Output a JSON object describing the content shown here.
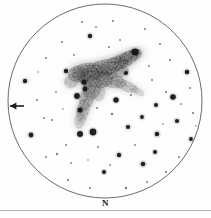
{
  "figure": {
    "kind": "astronomical-eyepiece-sketch",
    "width": 211,
    "height": 218,
    "background_color": "#fefefe",
    "caption": "N",
    "caption_x": 105,
    "caption_y": 198,
    "rule_y": 210,
    "rule_color": "#b4b4b4"
  },
  "field_circle": {
    "label": "eyepiece field of view",
    "cx": 105,
    "cy": 101,
    "r": 97,
    "stroke": "#5a5a5a",
    "stroke_width": 0.9,
    "fill": "none"
  },
  "direction_arrow": {
    "label": "direction marker arrow",
    "points_to": "left",
    "x1": 24,
    "y1": 106,
    "x2": 10,
    "y2": 106,
    "color": "#1c1c1c",
    "stroke_width": 1.6,
    "head_size": 4
  },
  "nebula": {
    "label": "diffuse nebula",
    "color": "#8e8e8e",
    "blobs": [
      {
        "cx": 120,
        "cy": 62,
        "rx": 26,
        "ry": 8,
        "rot": -24,
        "op": 0.42
      },
      {
        "cx": 104,
        "cy": 68,
        "rx": 28,
        "ry": 9,
        "rot": -16,
        "op": 0.46
      },
      {
        "cx": 128,
        "cy": 57,
        "rx": 16,
        "ry": 6,
        "rot": -27,
        "op": 0.5
      },
      {
        "cx": 88,
        "cy": 72,
        "rx": 18,
        "ry": 10,
        "rot": -6,
        "op": 0.45
      },
      {
        "cx": 78,
        "cy": 74,
        "rx": 11,
        "ry": 9,
        "rot": 0,
        "op": 0.38
      },
      {
        "cx": 95,
        "cy": 78,
        "rx": 20,
        "ry": 11,
        "rot": 8,
        "op": 0.4
      },
      {
        "cx": 110,
        "cy": 80,
        "rx": 18,
        "ry": 8,
        "rot": 14,
        "op": 0.34
      },
      {
        "cx": 126,
        "cy": 86,
        "rx": 14,
        "ry": 6,
        "rot": 22,
        "op": 0.26
      },
      {
        "cx": 137,
        "cy": 91,
        "rx": 9,
        "ry": 4,
        "rot": 26,
        "op": 0.2
      },
      {
        "cx": 92,
        "cy": 88,
        "rx": 10,
        "ry": 13,
        "rot": 16,
        "op": 0.36
      },
      {
        "cx": 87,
        "cy": 98,
        "rx": 8,
        "ry": 14,
        "rot": 14,
        "op": 0.34
      },
      {
        "cx": 83,
        "cy": 110,
        "rx": 7,
        "ry": 13,
        "rot": 12,
        "op": 0.3
      },
      {
        "cx": 80,
        "cy": 120,
        "rx": 6,
        "ry": 10,
        "rot": 10,
        "op": 0.24
      },
      {
        "cx": 99,
        "cy": 93,
        "rx": 7,
        "ry": 9,
        "rot": 0,
        "op": 0.22
      },
      {
        "cx": 71,
        "cy": 82,
        "rx": 8,
        "ry": 7,
        "rot": 0,
        "op": 0.28
      },
      {
        "cx": 116,
        "cy": 72,
        "rx": 14,
        "ry": 7,
        "rot": -10,
        "op": 0.3
      }
    ]
  },
  "stars": {
    "label": "plotted field stars",
    "color": "#141414",
    "list": [
      {
        "x": 135,
        "y": 52,
        "r": 3.6
      },
      {
        "x": 93,
        "y": 132,
        "r": 3.4
      },
      {
        "x": 80,
        "y": 134,
        "r": 3.0
      },
      {
        "x": 77,
        "y": 96,
        "r": 2.9
      },
      {
        "x": 84,
        "y": 82,
        "r": 2.6
      },
      {
        "x": 85,
        "y": 89,
        "r": 2.4
      },
      {
        "x": 80,
        "y": 110,
        "r": 2.6
      },
      {
        "x": 173,
        "y": 97,
        "r": 2.8
      },
      {
        "x": 116,
        "y": 100,
        "r": 2.7
      },
      {
        "x": 66,
        "y": 71,
        "r": 2.2
      },
      {
        "x": 25,
        "y": 81,
        "r": 2.2
      },
      {
        "x": 31,
        "y": 135,
        "r": 2.4
      },
      {
        "x": 187,
        "y": 72,
        "r": 2.3
      },
      {
        "x": 126,
        "y": 73,
        "r": 2.1
      },
      {
        "x": 90,
        "y": 36,
        "r": 2.2
      },
      {
        "x": 157,
        "y": 134,
        "r": 2.3
      },
      {
        "x": 143,
        "y": 164,
        "r": 2.3
      },
      {
        "x": 119,
        "y": 155,
        "r": 2.2
      },
      {
        "x": 177,
        "y": 121,
        "r": 2.1
      },
      {
        "x": 156,
        "y": 105,
        "r": 2.0
      },
      {
        "x": 128,
        "y": 127,
        "r": 2.1
      },
      {
        "x": 142,
        "y": 117,
        "r": 1.9
      },
      {
        "x": 104,
        "y": 172,
        "r": 2.0
      },
      {
        "x": 155,
        "y": 152,
        "r": 2.0
      },
      {
        "x": 191,
        "y": 139,
        "r": 1.9
      },
      {
        "x": 112,
        "y": 114,
        "r": 1.2
      },
      {
        "x": 57,
        "y": 154,
        "r": 1.2
      },
      {
        "x": 97,
        "y": 108,
        "r": 1.0
      },
      {
        "x": 46,
        "y": 157,
        "r": 1.0
      },
      {
        "x": 68,
        "y": 180,
        "r": 1.1
      },
      {
        "x": 90,
        "y": 188,
        "r": 1.0
      },
      {
        "x": 126,
        "y": 188,
        "r": 1.2
      },
      {
        "x": 147,
        "y": 182,
        "r": 1.0
      },
      {
        "x": 166,
        "y": 172,
        "r": 1.1
      },
      {
        "x": 179,
        "y": 157,
        "r": 1.0
      },
      {
        "x": 193,
        "y": 113,
        "r": 1.1
      },
      {
        "x": 190,
        "y": 88,
        "r": 1.0
      },
      {
        "x": 170,
        "y": 60,
        "r": 1.1
      },
      {
        "x": 160,
        "y": 44,
        "r": 1.0
      },
      {
        "x": 145,
        "y": 29,
        "r": 1.0
      },
      {
        "x": 113,
        "y": 21,
        "r": 1.1
      },
      {
        "x": 82,
        "y": 22,
        "r": 1.0
      },
      {
        "x": 62,
        "y": 42,
        "r": 1.0
      },
      {
        "x": 46,
        "y": 58,
        "r": 1.0
      },
      {
        "x": 37,
        "y": 100,
        "r": 1.0
      },
      {
        "x": 52,
        "y": 120,
        "r": 1.0
      },
      {
        "x": 66,
        "y": 145,
        "r": 1.0
      },
      {
        "x": 98,
        "y": 147,
        "r": 1.0
      },
      {
        "x": 135,
        "y": 145,
        "r": 0.9
      },
      {
        "x": 166,
        "y": 92,
        "r": 1.1
      },
      {
        "x": 152,
        "y": 80,
        "r": 1.0
      },
      {
        "x": 131,
        "y": 95,
        "r": 1.0
      },
      {
        "x": 109,
        "y": 47,
        "r": 1.0
      },
      {
        "x": 96,
        "y": 27,
        "r": 0.9
      },
      {
        "x": 74,
        "y": 55,
        "r": 0.9
      },
      {
        "x": 56,
        "y": 92,
        "r": 0.9
      },
      {
        "x": 44,
        "y": 118,
        "r": 0.9
      },
      {
        "x": 71,
        "y": 163,
        "r": 0.9
      },
      {
        "x": 110,
        "y": 165,
        "r": 0.9
      },
      {
        "x": 181,
        "y": 104,
        "r": 0.9
      },
      {
        "x": 149,
        "y": 66,
        "r": 0.9
      },
      {
        "x": 120,
        "y": 40,
        "r": 0.9
      },
      {
        "x": 63,
        "y": 109,
        "r": 0.8
      },
      {
        "x": 38,
        "y": 72,
        "r": 0.8
      },
      {
        "x": 88,
        "y": 160,
        "r": 0.8
      },
      {
        "x": 163,
        "y": 124,
        "r": 0.8
      },
      {
        "x": 196,
        "y": 126,
        "r": 0.8
      }
    ]
  }
}
